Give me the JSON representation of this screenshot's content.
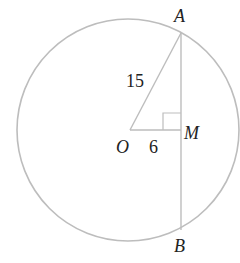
{
  "diagram": {
    "type": "circle-chord-geometry",
    "points": {
      "A": {
        "label": "A"
      },
      "B": {
        "label": "B"
      },
      "O": {
        "label": "O"
      },
      "M": {
        "label": "M"
      }
    },
    "segments": {
      "OA": {
        "label": "15"
      },
      "OM": {
        "label": "6"
      }
    },
    "colors": {
      "circle": "#bdbdbd",
      "lines": "#bdbdbd",
      "text": "#222222"
    }
  }
}
